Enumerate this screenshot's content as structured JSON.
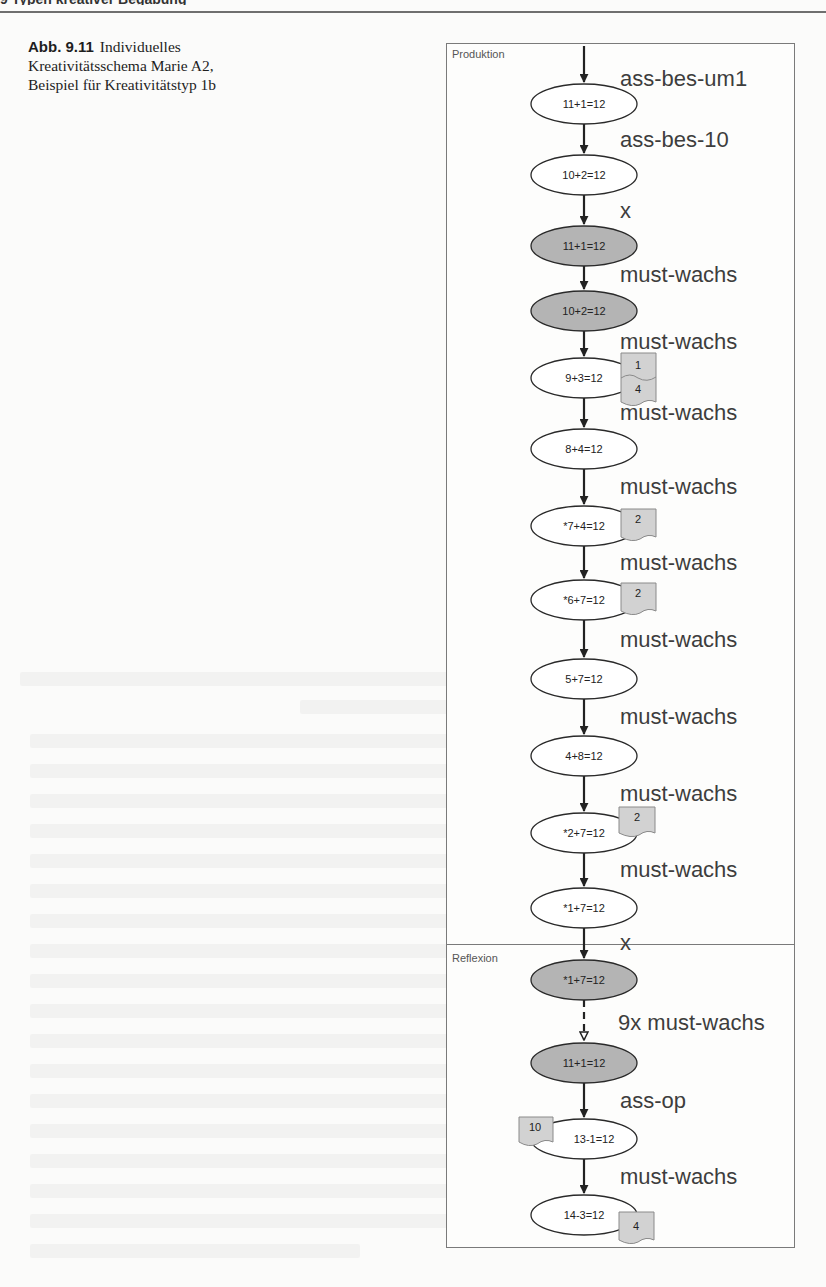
{
  "page": {
    "header_cut_text": "9 Typen kreativer Begabung"
  },
  "caption": {
    "label": "Abb. 9.11",
    "text": "Individuelles Kreativitätsschema Marie A2, Beispiel für Kreativitätstyp 1b"
  },
  "diagram": {
    "sections": [
      {
        "name": "Produktion"
      },
      {
        "name": "Reflexion"
      }
    ],
    "colors": {
      "node_white": "#ffffff",
      "node_gray": "#b4b4b4",
      "badge_fill": "#d2d2d2",
      "stroke": "#2a2a2a",
      "label": "#3d3d3d"
    },
    "nodes": [
      {
        "id": "n1",
        "text": "11+1=12",
        "fill": "white",
        "section": "Produktion"
      },
      {
        "id": "n2",
        "text": "10+2=12",
        "fill": "white",
        "section": "Produktion"
      },
      {
        "id": "n3",
        "text": "11+1=12",
        "fill": "gray",
        "section": "Produktion"
      },
      {
        "id": "n4",
        "text": "10+2=12",
        "fill": "gray",
        "section": "Produktion"
      },
      {
        "id": "n5",
        "text": "9+3=12",
        "fill": "white",
        "section": "Produktion",
        "badge": {
          "side": "right",
          "values": [
            "1",
            "4"
          ]
        }
      },
      {
        "id": "n6",
        "text": "8+4=12",
        "fill": "white",
        "section": "Produktion"
      },
      {
        "id": "n7",
        "text": "*7+4=12",
        "fill": "white",
        "section": "Produktion",
        "badge": {
          "side": "right",
          "values": [
            "2"
          ]
        }
      },
      {
        "id": "n8",
        "text": "*6+7=12",
        "fill": "white",
        "section": "Produktion",
        "badge": {
          "side": "right",
          "values": [
            "2"
          ]
        }
      },
      {
        "id": "n9",
        "text": "5+7=12",
        "fill": "white",
        "section": "Produktion"
      },
      {
        "id": "n10",
        "text": "4+8=12",
        "fill": "white",
        "section": "Produktion"
      },
      {
        "id": "n11",
        "text": "*2+7=12",
        "fill": "white",
        "section": "Produktion",
        "badge": {
          "side": "right",
          "values": [
            "2"
          ]
        }
      },
      {
        "id": "n12",
        "text": "*1+7=12",
        "fill": "white",
        "section": "Produktion"
      },
      {
        "id": "n13",
        "text": "*1+7=12",
        "fill": "gray",
        "section": "Reflexion"
      },
      {
        "id": "n14",
        "text": "11+1=12",
        "fill": "gray",
        "section": "Reflexion"
      },
      {
        "id": "n15",
        "text": "13-1=12",
        "fill": "white",
        "section": "Reflexion",
        "badge": {
          "side": "left",
          "values": [
            "10"
          ]
        }
      },
      {
        "id": "n16",
        "text": "14-3=12",
        "fill": "white",
        "section": "Reflexion",
        "badge": {
          "side": "right",
          "values": [
            "4"
          ]
        }
      }
    ],
    "edges": [
      {
        "from": "start",
        "to": "n1",
        "label": "ass-bes-um1",
        "style": "solid"
      },
      {
        "from": "n1",
        "to": "n2",
        "label": "ass-bes-10",
        "style": "solid"
      },
      {
        "from": "n2",
        "to": "n3",
        "label": "x",
        "style": "solid"
      },
      {
        "from": "n3",
        "to": "n4",
        "label": "must-wachs",
        "style": "solid"
      },
      {
        "from": "n4",
        "to": "n5",
        "label": "must-wachs",
        "style": "solid"
      },
      {
        "from": "n5",
        "to": "n6",
        "label": "must-wachs",
        "style": "solid"
      },
      {
        "from": "n6",
        "to": "n7",
        "label": "must-wachs",
        "style": "solid"
      },
      {
        "from": "n7",
        "to": "n8",
        "label": "must-wachs",
        "style": "solid"
      },
      {
        "from": "n8",
        "to": "n9",
        "label": "must-wachs",
        "style": "solid"
      },
      {
        "from": "n9",
        "to": "n10",
        "label": "must-wachs",
        "style": "solid"
      },
      {
        "from": "n10",
        "to": "n11",
        "label": "must-wachs",
        "style": "solid"
      },
      {
        "from": "n11",
        "to": "n12",
        "label": "must-wachs",
        "style": "solid"
      },
      {
        "from": "n12",
        "to": "n13",
        "label": "x",
        "style": "solid"
      },
      {
        "from": "n13",
        "to": "n14",
        "label": "9x must-wachs",
        "style": "dashed"
      },
      {
        "from": "n14",
        "to": "n15",
        "label": "ass-op",
        "style": "solid"
      },
      {
        "from": "n15",
        "to": "n16",
        "label": "must-wachs",
        "style": "solid"
      }
    ]
  }
}
